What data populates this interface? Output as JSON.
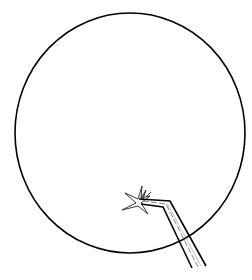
{
  "illustration": {
    "subject": "microscope-field-view",
    "elements": [
      "field-of-view-circle",
      "star-shaped-specimen",
      "tweezers"
    ],
    "colors": {
      "background": "#ffffff",
      "line": "#000000",
      "shading": "#555555"
    }
  }
}
